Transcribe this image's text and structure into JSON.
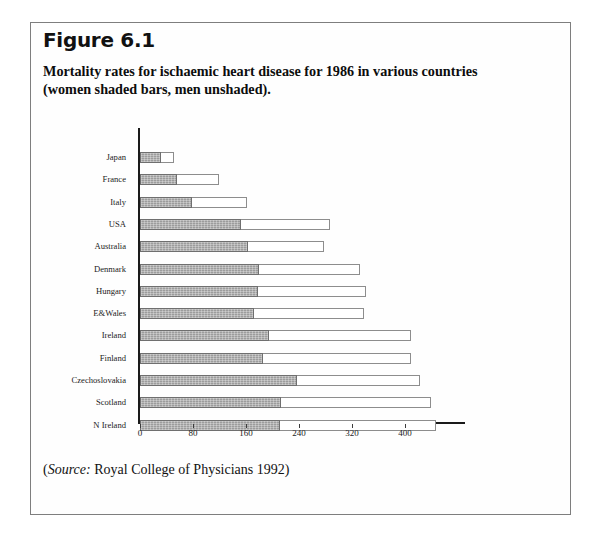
{
  "figure": {
    "number": "Figure 6.1",
    "caption": "Mortality rates for ischaemic heart disease for 1986 in various countries (women shaded bars, men unshaded).",
    "source_word": "Source:",
    "source_text": "Royal College of Physicians 1992)",
    "source_open_paren": "("
  },
  "chart_data": {
    "type": "bar",
    "orientation": "horizontal",
    "title": "Mortality rates for ischaemic heart disease for 1986 in various countries",
    "subtitle": "(women shaded bars, men unshaded).",
    "xlabel": "",
    "ylabel": "",
    "xlim": [
      0,
      470
    ],
    "xticks": [
      0,
      80,
      160,
      240,
      320,
      400
    ],
    "grid": false,
    "legend": "women shaded bars, men unshaded",
    "categories": [
      "Japan",
      "France",
      "Italy",
      "USA",
      "Australia",
      "Denmark",
      "Hungary",
      "E&Wales",
      "Ireland",
      "Finland",
      "Czechoslovakia",
      "Scotland",
      "N Ireland"
    ],
    "series": [
      {
        "name": "women",
        "shading": "shaded",
        "values": [
          31,
          56,
          79,
          152,
          163,
          179,
          178,
          172,
          194,
          186,
          237,
          213,
          212
        ]
      },
      {
        "name": "men",
        "shading": "unshaded",
        "values": [
          52,
          119,
          162,
          287,
          278,
          332,
          341,
          338,
          409,
          409,
          422,
          439,
          447
        ]
      }
    ]
  },
  "colors": {
    "women_fill": "#9c9c9c",
    "men_fill": "#ffffff",
    "bar_border": "#8d8d8d",
    "axis": "#1a1a1a",
    "frame": "#7e7e7e",
    "text": "#111111"
  }
}
